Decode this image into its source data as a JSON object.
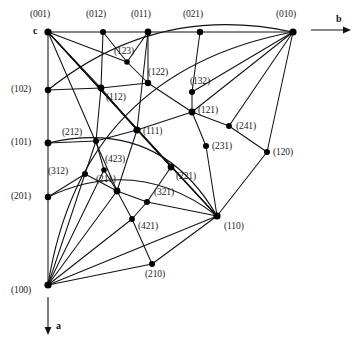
{
  "figure": {
    "type": "stereographic-projection",
    "line_color": "#111111",
    "node_color": "#000000",
    "background": "#ffffff",
    "width": 358,
    "height": 342
  },
  "axes": [
    {
      "name": "b-axis",
      "label": "b",
      "direction": "right",
      "x1": 311,
      "y1": 30,
      "x2": 347,
      "y2": 30,
      "label_x": 336,
      "label_y": 14
    },
    {
      "name": "a-axis",
      "label": "a",
      "direction": "down",
      "x1": 48,
      "y1": 297,
      "x2": 48,
      "y2": 331,
      "label_x": 56,
      "label_y": 321
    }
  ],
  "corner_label": {
    "text": "c",
    "x": 33,
    "y": 26
  },
  "nodes": [
    {
      "id": "001",
      "label": "(001)",
      "x": 48,
      "y": 32,
      "r": 3.6,
      "lx": 30,
      "ly": 10
    },
    {
      "id": "012",
      "label": "(012)",
      "x": 103,
      "y": 32,
      "r": 3.0,
      "lx": 86,
      "ly": 10
    },
    {
      "id": "011",
      "label": "(011)",
      "x": 148,
      "y": 32,
      "r": 3.4,
      "lx": 131,
      "ly": 10
    },
    {
      "id": "021",
      "label": "(021)",
      "x": 200,
      "y": 32,
      "r": 3.2,
      "lx": 183,
      "ly": 10
    },
    {
      "id": "010",
      "label": "(010)",
      "x": 293,
      "y": 32,
      "r": 3.6,
      "lx": 276,
      "ly": 10
    },
    {
      "id": "102",
      "label": "(102)",
      "x": 48,
      "y": 90,
      "r": 3.2,
      "lx": 11,
      "ly": 85
    },
    {
      "id": "101",
      "label": "(101)",
      "x": 48,
      "y": 143,
      "r": 3.4,
      "lx": 11,
      "ly": 138
    },
    {
      "id": "201",
      "label": "(201)",
      "x": 48,
      "y": 197,
      "r": 3.2,
      "lx": 11,
      "ly": 192
    },
    {
      "id": "100",
      "label": "(100)",
      "x": 48,
      "y": 285,
      "r": 3.6,
      "lx": 11,
      "ly": 286
    },
    {
      "id": "123",
      "label": "(123)",
      "x": 127,
      "y": 62,
      "r": 2.8,
      "lx": 114,
      "ly": 47
    },
    {
      "id": "112",
      "label": "(112)",
      "x": 101,
      "y": 88,
      "r": 3.4,
      "lx": 106,
      "ly": 93
    },
    {
      "id": "122",
      "label": "(122)",
      "x": 148,
      "y": 83,
      "r": 3.2,
      "lx": 148,
      "ly": 68
    },
    {
      "id": "132",
      "label": "(132)",
      "x": 192,
      "y": 92,
      "r": 3.0,
      "lx": 190,
      "ly": 77
    },
    {
      "id": "121",
      "label": "(121)",
      "x": 192,
      "y": 112,
      "r": 3.4,
      "lx": 198,
      "ly": 106
    },
    {
      "id": "241",
      "label": "(241)",
      "x": 229,
      "y": 126,
      "r": 2.9,
      "lx": 236,
      "ly": 122
    },
    {
      "id": "120",
      "label": "(120)",
      "x": 267,
      "y": 152,
      "r": 3.0,
      "lx": 273,
      "ly": 148
    },
    {
      "id": "231",
      "label": "(231)",
      "x": 206,
      "y": 146,
      "r": 3.0,
      "lx": 212,
      "ly": 142
    },
    {
      "id": "111",
      "label": "(111)",
      "x": 137,
      "y": 130,
      "r": 3.6,
      "lx": 143,
      "ly": 127
    },
    {
      "id": "212",
      "label": "(212)",
      "x": 96,
      "y": 141,
      "r": 3.0,
      "lx": 62,
      "ly": 128
    },
    {
      "id": "423",
      "label": "(423)",
      "x": 104,
      "y": 170,
      "r": 2.8,
      "lx": 105,
      "ly": 155
    },
    {
      "id": "312",
      "label": "(312)",
      "x": 85,
      "y": 174,
      "r": 3.0,
      "lx": 48,
      "ly": 167
    },
    {
      "id": "211",
      "label": "(211)",
      "x": 117,
      "y": 191,
      "r": 3.4,
      "lx": 96,
      "ly": 175
    },
    {
      "id": "221",
      "label": "(221)",
      "x": 171,
      "y": 167,
      "r": 3.4,
      "lx": 176,
      "ly": 172
    },
    {
      "id": "321",
      "label": "(321)",
      "x": 147,
      "y": 202,
      "r": 3.0,
      "lx": 154,
      "ly": 188
    },
    {
      "id": "421",
      "label": "(421)",
      "x": 132,
      "y": 219,
      "r": 2.9,
      "lx": 138,
      "ly": 222
    },
    {
      "id": "110",
      "label": "(110)",
      "x": 217,
      "y": 216,
      "r": 3.6,
      "lx": 224,
      "ly": 222
    },
    {
      "id": "210",
      "label": "(210)",
      "x": 152,
      "y": 264,
      "r": 3.0,
      "lx": 145,
      "ly": 270
    }
  ],
  "edges": {
    "straight": [
      [
        "001",
        "012"
      ],
      [
        "012",
        "011"
      ],
      [
        "011",
        "021"
      ],
      [
        "021",
        "010"
      ],
      [
        "001",
        "102"
      ],
      [
        "102",
        "101"
      ],
      [
        "101",
        "201"
      ],
      [
        "201",
        "100"
      ],
      [
        "012",
        "112"
      ],
      [
        "011",
        "122"
      ],
      [
        "011",
        "123"
      ],
      [
        "021",
        "132"
      ],
      [
        "001",
        "123"
      ],
      [
        "001",
        "112"
      ],
      [
        "001",
        "111"
      ],
      [
        "001",
        "211"
      ],
      [
        "001",
        "221"
      ],
      [
        "001",
        "110"
      ],
      [
        "100",
        "312"
      ],
      [
        "100",
        "211"
      ],
      [
        "100",
        "423"
      ],
      [
        "100",
        "421"
      ],
      [
        "100",
        "210"
      ],
      [
        "100",
        "110"
      ],
      [
        "101",
        "212"
      ],
      [
        "201",
        "312"
      ],
      [
        "102",
        "112"
      ],
      [
        "010",
        "132"
      ],
      [
        "010",
        "121"
      ],
      [
        "010",
        "241"
      ],
      [
        "010",
        "120"
      ],
      [
        "121",
        "241"
      ],
      [
        "241",
        "120"
      ],
      [
        "120",
        "110"
      ],
      [
        "121",
        "231"
      ],
      [
        "231",
        "110"
      ],
      [
        "221",
        "110"
      ],
      [
        "321",
        "110"
      ],
      [
        "122",
        "121"
      ],
      [
        "132",
        "121"
      ],
      [
        "112",
        "122"
      ],
      [
        "112",
        "111"
      ],
      [
        "111",
        "121"
      ],
      [
        "111",
        "221"
      ],
      [
        "111",
        "211"
      ],
      [
        "212",
        "112"
      ],
      [
        "212",
        "423"
      ],
      [
        "423",
        "211"
      ],
      [
        "212",
        "111"
      ],
      [
        "211",
        "321"
      ],
      [
        "321",
        "221"
      ],
      [
        "211",
        "421"
      ],
      [
        "421",
        "210"
      ],
      [
        "312",
        "212"
      ],
      [
        "312",
        "211"
      ],
      [
        "011",
        "111"
      ],
      [
        "012",
        "123"
      ],
      [
        "123",
        "122"
      ],
      [
        "421",
        "321"
      ],
      [
        "210",
        "110"
      ]
    ],
    "arcs": [
      {
        "from": "102",
        "to": "010",
        "via": [
          "112",
          "121"
        ],
        "sag": 30,
        "name": "zone-circle-102-010"
      },
      {
        "from": "101",
        "to": "110",
        "via": [
          "212",
          "111",
          "221"
        ],
        "sag": 34,
        "name": "zone-circle-101-110"
      },
      {
        "from": "201",
        "to": "110",
        "via": [
          "312",
          "211",
          "321"
        ],
        "sag": 26,
        "name": "zone-circle-201-110"
      },
      {
        "from": "010",
        "to": "100",
        "via": [
          "120",
          "110",
          "210"
        ],
        "sag": 62,
        "name": "outer-great-circle"
      },
      {
        "from": "001",
        "to": "110",
        "via": [],
        "sag": 0,
        "name": "diagonal-001-110"
      }
    ]
  }
}
